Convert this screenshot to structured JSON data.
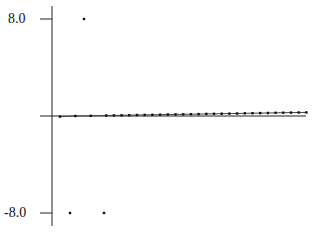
{
  "chart_data": {
    "type": "scatter",
    "title": "",
    "xlabel": "",
    "ylabel": "",
    "yticks": [
      8.0,
      -8.0
    ],
    "ytick_labels": [
      "8.0",
      "-8.0"
    ],
    "ylim": [
      -9.8,
      9.8
    ],
    "grid": false,
    "legend": null,
    "series": [
      {
        "name": "points",
        "x": [
          1,
          3,
          5,
          7,
          8,
          9,
          10,
          11,
          12,
          13,
          14,
          15,
          16,
          17,
          18,
          19,
          20,
          21,
          22,
          23,
          24,
          25,
          26,
          27,
          28,
          29,
          30,
          31,
          32,
          33
        ],
        "y": [
          -0.05,
          0.0,
          0.02,
          0.04,
          0.05,
          0.06,
          0.07,
          0.08,
          0.09,
          0.1,
          0.11,
          0.12,
          0.13,
          0.14,
          0.15,
          0.16,
          0.17,
          0.18,
          0.19,
          0.2,
          0.21,
          0.22,
          0.23,
          0.24,
          0.25,
          0.26,
          0.27,
          0.28,
          0.29,
          0.3
        ]
      },
      {
        "name": "outliers",
        "x": [
          4,
          2,
          6
        ],
        "y": [
          8.0,
          -8.0,
          -8.0
        ]
      }
    ]
  },
  "axes": {
    "y_top_label": "8.0",
    "y_bottom_label": "-8.0"
  }
}
